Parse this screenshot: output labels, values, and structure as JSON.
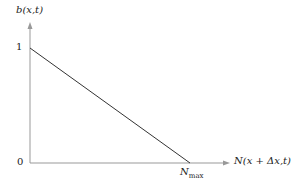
{
  "diagram": {
    "y_axis_label": "b(x,t)",
    "x_axis_label": "N(x + Δx,t)",
    "y_ticks": [
      "1",
      "0"
    ],
    "x_tick_label_main": "N",
    "x_tick_label_sub": "max",
    "line": {
      "from": [
        0,
        1
      ],
      "to": [
        "Nmax",
        0
      ]
    },
    "colors": {
      "axis": "#999999",
      "line": "#333333",
      "text": "#222222"
    }
  }
}
